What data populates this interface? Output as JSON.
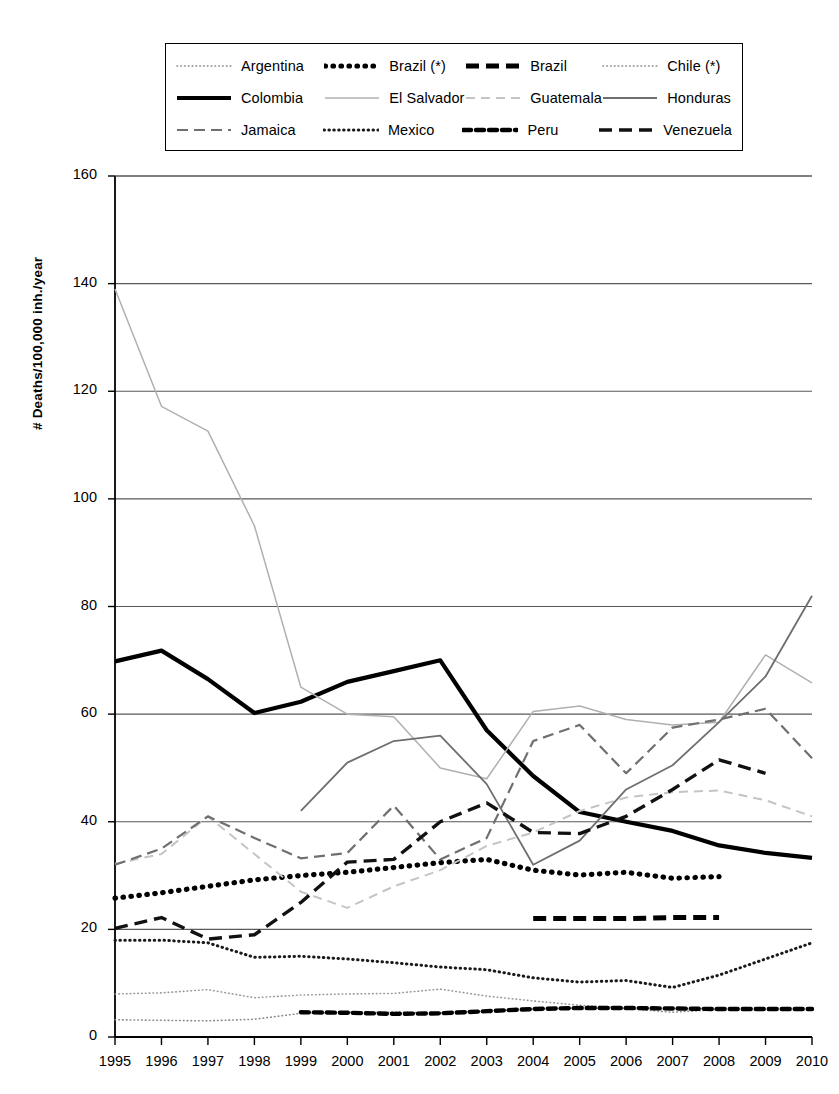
{
  "chart_data": {
    "type": "line",
    "title": "",
    "xlabel": "",
    "ylabel": "# Deaths/100,000 inh./year",
    "x": [
      1995,
      1996,
      1997,
      1998,
      1999,
      2000,
      2001,
      2002,
      2003,
      2004,
      2005,
      2006,
      2007,
      2008,
      2009,
      2010
    ],
    "xtick_labels": [
      "1995",
      "1996",
      "1997",
      "1998",
      "1999",
      "2000",
      "2001",
      "2002",
      "2003",
      "2004",
      "2005",
      "2006",
      "2007",
      "2008",
      "2009",
      "2010"
    ],
    "ytick_labels": [
      "0",
      "20",
      "40",
      "60",
      "80",
      "100",
      "120",
      "140",
      "160"
    ],
    "yticks": [
      0,
      20,
      40,
      60,
      80,
      100,
      120,
      140,
      160
    ],
    "ylim": [
      0,
      160
    ],
    "xlim": [
      1995,
      2010
    ],
    "grid": "horizontal",
    "legend_position": "top",
    "series": [
      {
        "name": "Argentina",
        "style": "fine-dotted",
        "color": "#8a8a8a",
        "x": [
          1995,
          1996,
          1997,
          1998,
          1999,
          2000,
          2001,
          2002,
          2003,
          2004,
          2005,
          2006,
          2007,
          2008
        ],
        "values": [
          3.2,
          3.1,
          3.0,
          3.3,
          4.4,
          4.6,
          4.6,
          4.5,
          4.8,
          5.2,
          5.4,
          5.3,
          4.6,
          5.1
        ]
      },
      {
        "name": "Brazil (*)",
        "style": "thick-dotted",
        "color": "#000000",
        "x": [
          1995,
          1996,
          1997,
          1998,
          1999,
          2000,
          2001,
          2002,
          2003,
          2004,
          2005,
          2006,
          2007,
          2008
        ],
        "values": [
          25.8,
          26.8,
          28.0,
          29.2,
          30.0,
          30.6,
          31.5,
          32.4,
          33.0,
          31.0,
          30.1,
          30.6,
          29.5,
          29.8
        ]
      },
      {
        "name": "Brazil",
        "style": "thick-dashed",
        "color": "#000000",
        "x": [
          2004,
          2005,
          2006,
          2007,
          2008
        ],
        "values": [
          22.0,
          22.0,
          22.0,
          22.2,
          22.2
        ]
      },
      {
        "name": "Chile (*)",
        "style": "fine-dotted",
        "color": "#9a9a9a",
        "x": [
          1995,
          1996,
          1997,
          1998,
          1999,
          2000,
          2001,
          2002,
          2003,
          2004,
          2005,
          2006,
          2007,
          2008
        ],
        "values": [
          8.0,
          8.2,
          8.8,
          7.3,
          7.8,
          8.0,
          8.1,
          8.9,
          7.6,
          6.7,
          5.9,
          5.4,
          5.3,
          5.3
        ]
      },
      {
        "name": "Colombia",
        "style": "thick-solid",
        "color": "#000000",
        "x": [
          1995,
          1996,
          1997,
          1998,
          1999,
          2000,
          2001,
          2002,
          2003,
          2004,
          2005,
          2006,
          2007,
          2008,
          2009,
          2010
        ],
        "values": [
          69.8,
          71.8,
          66.5,
          60.2,
          62.3,
          66.0,
          68.0,
          70.0,
          57.0,
          48.5,
          41.8,
          40.0,
          38.3,
          35.6,
          34.2,
          33.3
        ]
      },
      {
        "name": "El Salvador",
        "style": "thin-solid-light",
        "color": "#b0b0b0",
        "x": [
          1995,
          1996,
          1997,
          1998,
          1999,
          2000,
          2001,
          2002,
          2003,
          2004,
          2005,
          2006,
          2007,
          2008,
          2009,
          2010
        ],
        "values": [
          139.0,
          117.2,
          112.6,
          95.0,
          65.0,
          60.0,
          59.5,
          50.0,
          48.0,
          60.5,
          61.5,
          59.0,
          58.0,
          58.5,
          71.0,
          65.8
        ]
      },
      {
        "name": "Guatemala",
        "style": "light-dashed",
        "color": "#c4c4c4",
        "x": [
          1995,
          1996,
          1997,
          1998,
          1999,
          2000,
          2001,
          2002,
          2003,
          2004,
          2005,
          2006,
          2007,
          2008,
          2009,
          2010
        ],
        "values": [
          32.2,
          34.0,
          41.0,
          34.0,
          27.0,
          24.0,
          28.0,
          31.0,
          35.5,
          38.0,
          42.0,
          44.5,
          45.5,
          45.8,
          44.0,
          41.0
        ]
      },
      {
        "name": "Honduras",
        "style": "thin-solid-mid",
        "color": "#6e6e6e",
        "x": [
          1999,
          2000,
          2001,
          2002,
          2003,
          2004,
          2005,
          2006,
          2007,
          2008,
          2009,
          2010
        ],
        "values": [
          42.0,
          51.0,
          55.0,
          56.0,
          47.0,
          32.0,
          36.5,
          46.0,
          50.5,
          58.5,
          67.0,
          82.0
        ]
      },
      {
        "name": "Jamaica",
        "style": "mid-dashed",
        "color": "#6f6f6f",
        "x": [
          1995,
          1996,
          1997,
          1998,
          1999,
          2000,
          2001,
          2002,
          2003,
          2004,
          2005,
          2006,
          2007,
          2008,
          2009,
          2010
        ],
        "values": [
          32.0,
          35.0,
          41.0,
          37.0,
          33.2,
          34.2,
          43.0,
          33.0,
          37.0,
          55.0,
          58.0,
          49.0,
          57.5,
          59.0,
          61.0,
          51.8
        ]
      },
      {
        "name": "Mexico",
        "style": "dotted",
        "color": "#1a1a1a",
        "x": [
          1995,
          1996,
          1997,
          1998,
          1999,
          2000,
          2001,
          2002,
          2003,
          2004,
          2005,
          2006,
          2007,
          2008,
          2009,
          2010
        ],
        "values": [
          18.0,
          18.0,
          17.5,
          14.8,
          15.0,
          14.5,
          13.8,
          13.0,
          12.5,
          11.0,
          10.2,
          10.5,
          9.2,
          11.5,
          14.5,
          17.5
        ]
      },
      {
        "name": "Peru",
        "style": "dash-oval",
        "color": "#000000",
        "x": [
          1999,
          2000,
          2001,
          2002,
          2003,
          2004,
          2005,
          2006,
          2007,
          2008,
          2009,
          2010
        ],
        "values": [
          4.6,
          4.5,
          4.3,
          4.4,
          4.8,
          5.2,
          5.4,
          5.4,
          5.3,
          5.2,
          5.2,
          5.2
        ]
      },
      {
        "name": "Venezuela",
        "style": "dark-dashed",
        "color": "#111111",
        "x": [
          1995,
          1996,
          1997,
          1998,
          1999,
          2000,
          2001,
          2002,
          2003,
          2004,
          2005,
          2006,
          2007,
          2008,
          2009
        ],
        "values": [
          20.2,
          22.2,
          18.2,
          19.0,
          25.0,
          32.5,
          33.0,
          40.0,
          43.5,
          38.0,
          37.8,
          41.0,
          46.0,
          51.5,
          49.0
        ]
      }
    ]
  },
  "legend": {
    "rows": [
      [
        {
          "name": "Argentina",
          "style": "fine-dotted"
        },
        {
          "name": "Brazil (*)",
          "style": "thick-dotted"
        },
        {
          "name": "Brazil",
          "style": "thick-dashed"
        },
        {
          "name": "Chile (*)",
          "style": "fine-dotted"
        }
      ],
      [
        {
          "name": "Colombia",
          "style": "thick-solid"
        },
        {
          "name": "El Salvador",
          "style": "thin-solid-light"
        },
        {
          "name": "Guatemala",
          "style": "light-dashed"
        },
        {
          "name": "Honduras",
          "style": "thin-solid-mid"
        }
      ],
      [
        {
          "name": "Jamaica",
          "style": "mid-dashed"
        },
        {
          "name": "Mexico",
          "style": "dotted"
        },
        {
          "name": "Peru",
          "style": "dash-oval"
        },
        {
          "name": "Venezuela",
          "style": "dark-dashed"
        }
      ]
    ]
  }
}
